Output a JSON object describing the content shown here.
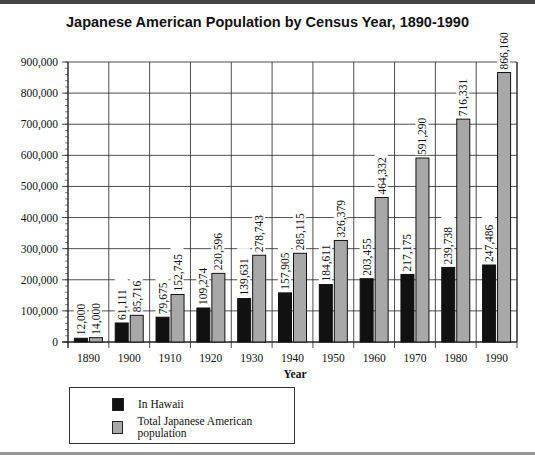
{
  "chart_data": {
    "type": "bar",
    "title": "Japanese American Population by Census Year, 1890-1990",
    "xlabel": "Year",
    "ylabel": "",
    "ylim": [
      0,
      900000
    ],
    "yticks": [
      "0",
      "100,000",
      "200,000",
      "300,000",
      "400,000",
      "500,000",
      "600,000",
      "700,000",
      "800,000",
      "900,000"
    ],
    "grid": true,
    "legend_position": "bottom-left below plot",
    "categories": [
      "1890",
      "1900",
      "1910",
      "1920",
      "1930",
      "1940",
      "1950",
      "1960",
      "1970",
      "1980",
      "1990"
    ],
    "series": [
      {
        "name": "In Hawaii",
        "color": "#111111",
        "values": [
          12000,
          61111,
          79675,
          109274,
          139631,
          157905,
          184611,
          203455,
          217175,
          239738,
          247486
        ],
        "labels": [
          "12,000",
          "61,111",
          "79,675",
          "109,274",
          "139,631",
          "157,905",
          "184,611",
          "203,455",
          "217,175",
          "239,738",
          "247,486"
        ]
      },
      {
        "name": "Total Japanese American population",
        "color": "#a8a8a8",
        "values": [
          14000,
          85716,
          152745,
          220596,
          278743,
          285115,
          326379,
          464332,
          591290,
          716331,
          866160
        ],
        "labels": [
          "14,000",
          "85,716",
          "152,745",
          "220,596",
          "278,743",
          "285,115",
          "326,379",
          "464,332",
          "591,290",
          "716,331",
          "866,160"
        ]
      }
    ]
  },
  "legend": {
    "items": [
      {
        "label": "In Hawaii",
        "color": "#111111"
      },
      {
        "label": "Total Japanese American population",
        "color": "#a8a8a8"
      }
    ]
  }
}
